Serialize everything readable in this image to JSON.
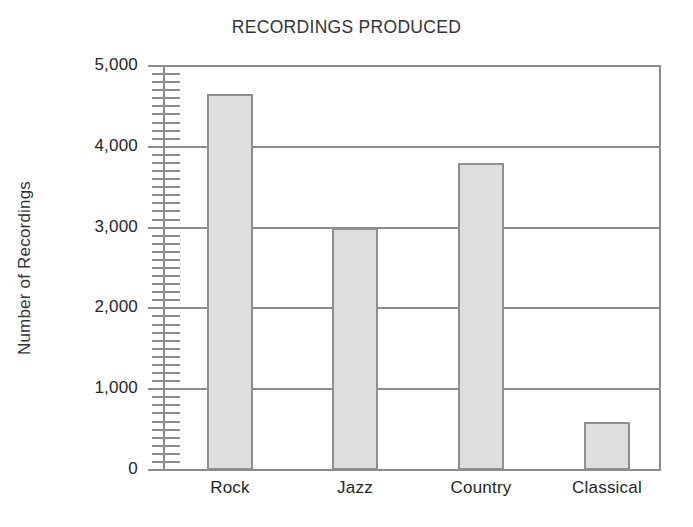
{
  "chart_data": {
    "type": "bar",
    "title": "RECORDINGS PRODUCED",
    "xlabel": "",
    "ylabel": "Number of Recordings",
    "categories": [
      "Rock",
      "Jazz",
      "Country",
      "Classical"
    ],
    "values": [
      4650,
      3000,
      3800,
      600
    ],
    "ylim": [
      0,
      5000
    ],
    "ytick_labels": [
      "0",
      "1,000",
      "2,000",
      "3,000",
      "4,000",
      "5,000"
    ],
    "ytick_values": [
      0,
      1000,
      2000,
      3000,
      4000,
      5000
    ],
    "minor_tick_interval": 100,
    "grid": "horizontal",
    "legend": "none",
    "bar_fill_color": "#dedede",
    "bar_edge_color": "#8f8f8f",
    "axis_color": "#8c8c8c",
    "text_color": "#262626",
    "background_color": "#ffffff"
  }
}
